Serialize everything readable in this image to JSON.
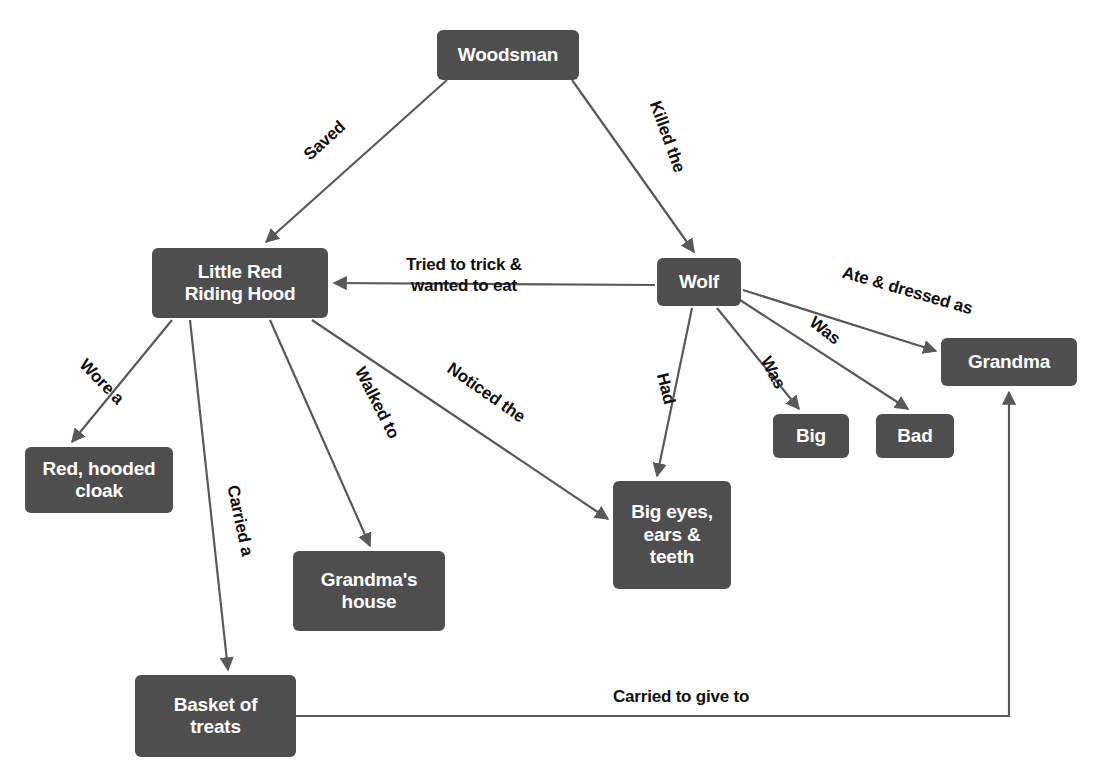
{
  "diagram": {
    "type": "concept-map",
    "colors": {
      "node_fill": "#4e4e4e",
      "node_text": "#ffffff",
      "edge_line": "#595959",
      "label_text": "#111111",
      "background": "#ffffff"
    },
    "nodes": [
      {
        "id": "woodsman",
        "label": "Woodsman",
        "x": 437,
        "y": 30,
        "w": 142,
        "h": 50
      },
      {
        "id": "little_red",
        "label": "Little Red\nRiding Hood",
        "x": 152,
        "y": 248,
        "w": 176,
        "h": 70
      },
      {
        "id": "wolf",
        "label": "Wolf",
        "x": 657,
        "y": 258,
        "w": 84,
        "h": 48
      },
      {
        "id": "grandma",
        "label": "Grandma",
        "x": 941,
        "y": 338,
        "w": 136,
        "h": 48
      },
      {
        "id": "big",
        "label": "Big",
        "x": 773,
        "y": 414,
        "w": 76,
        "h": 44
      },
      {
        "id": "bad",
        "label": "Bad",
        "x": 876,
        "y": 414,
        "w": 78,
        "h": 44
      },
      {
        "id": "cloak",
        "label": "Red, hooded\ncloak",
        "x": 25,
        "y": 447,
        "w": 148,
        "h": 66
      },
      {
        "id": "big_eyes",
        "label": "Big eyes,\nears &\nteeth",
        "x": 613,
        "y": 481,
        "w": 118,
        "h": 108
      },
      {
        "id": "house",
        "label": "Grandma's\nhouse",
        "x": 293,
        "y": 551,
        "w": 152,
        "h": 80
      },
      {
        "id": "basket",
        "label": "Basket of\ntreats",
        "x": 135,
        "y": 675,
        "w": 161,
        "h": 82
      }
    ],
    "edges": [
      {
        "id": "woodsman-little_red",
        "from": "woodsman",
        "to": "little_red",
        "label": "Saved",
        "label_x": 300,
        "label_y": 130,
        "rotate": -42
      },
      {
        "id": "woodsman-wolf",
        "from": "woodsman",
        "to": "wolf",
        "label": "Killed the",
        "label_x": 630,
        "label_y": 126,
        "rotate": 70
      },
      {
        "id": "wolf-little_red",
        "from": "wolf",
        "to": "little_red",
        "label": "Tried to trick &\nwanted to eat",
        "label_x": 406,
        "label_y": 254,
        "rotate": 0
      },
      {
        "id": "wolf-grandma",
        "from": "wolf",
        "to": "grandma",
        "label": "Ate & dressed as",
        "label_x": 840,
        "label_y": 280,
        "rotate": 16
      },
      {
        "id": "wolf-bad",
        "from": "wolf",
        "to": "bad",
        "label": "Was",
        "label_x": 808,
        "label_y": 320,
        "rotate": 38
      },
      {
        "id": "wolf-big",
        "from": "wolf",
        "to": "big",
        "label": "Was",
        "label_x": 756,
        "label_y": 362,
        "rotate": 62
      },
      {
        "id": "wolf-big_eyes",
        "from": "wolf",
        "to": "big_eyes",
        "label": "Had",
        "label_x": 650,
        "label_y": 378,
        "rotate": 76
      },
      {
        "id": "little_red-cloak",
        "from": "little_red",
        "to": "cloak",
        "label": "Wore a",
        "label_x": 74,
        "label_y": 371,
        "rotate": 46
      },
      {
        "id": "little_red-basket",
        "from": "little_red",
        "to": "basket",
        "label": "Carried a",
        "label_x": 204,
        "label_y": 510,
        "rotate": 78
      },
      {
        "id": "little_red-house",
        "from": "little_red",
        "to": "house",
        "label": "Walked to",
        "label_x": 338,
        "label_y": 392,
        "rotate": 63
      },
      {
        "id": "little_red-big_eyes",
        "from": "little_red",
        "to": "big_eyes",
        "label": "Noticed the",
        "label_x": 441,
        "label_y": 382,
        "rotate": 35
      },
      {
        "id": "basket-grandma",
        "from": "basket",
        "to": "grandma",
        "label": "Carried to give to",
        "label_x": 613,
        "label_y": 686,
        "rotate": 0
      }
    ]
  }
}
